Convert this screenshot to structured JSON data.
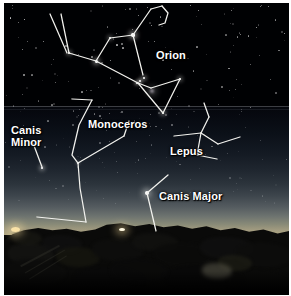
{
  "image": {
    "kind": "night-sky-photograph",
    "title": "Winter constellations above a dark rocky horizon",
    "width": 291,
    "height": 296
  },
  "labels": [
    {
      "id": "orion",
      "text": "Orion",
      "x": 152,
      "y": 47,
      "lines": [
        "Orion"
      ]
    },
    {
      "id": "monoceros",
      "text": "Monoceros",
      "x": 84,
      "y": 116,
      "lines": [
        "Monoceros"
      ]
    },
    {
      "id": "canis-minor",
      "text": "Canis\nMinor",
      "x": 7,
      "y": 122,
      "lines": [
        "Canis",
        "Minor"
      ]
    },
    {
      "id": "lepus",
      "text": "Lepus",
      "x": 166,
      "y": 143,
      "lines": [
        "Lepus"
      ]
    },
    {
      "id": "canis-major",
      "text": "Canis Major",
      "x": 155,
      "y": 188,
      "lines": [
        "Canis Major"
      ]
    }
  ],
  "constellations": [
    {
      "name": "Orion",
      "segments": [
        "46,11 63,50",
        "57,11 65,50",
        "65,50 92,58",
        "92,58 106,35",
        "106,35 129,32",
        "129,32 147,6",
        "147,6 158,3",
        "158,3 164,10 161,20 155,22",
        "129,32 139,72",
        "92,58 134,80",
        "134,80 147,85",
        "147,85 176,76",
        "176,76 159,110",
        "159,110 134,80"
      ]
    },
    {
      "name": "Monoceros",
      "segments": [
        "68,96 88,97",
        "88,97 75,122 68,152 74,160",
        "74,160 120,133",
        "120,133 125,118",
        "74,160 76,185 82,219",
        "82,219 33,214"
      ]
    },
    {
      "name": "Canis Minor",
      "segments": [
        "29,140 38,164"
      ]
    },
    {
      "name": "Lepus",
      "segments": [
        "170,133 197,130",
        "197,130 205,114",
        "205,114 200,100",
        "197,130 214,141",
        "214,141 236,134",
        "197,130 193,152",
        "193,152 213,156"
      ]
    },
    {
      "name": "Canis Major",
      "segments": [
        "143,190 164,172",
        "143,190 152,228"
      ]
    }
  ],
  "stars": [
    {
      "name": "Betelgeuse",
      "x": 129,
      "y": 32,
      "size": 3.4,
      "brightness": 1.0
    },
    {
      "name": "Bellatrix",
      "x": 106,
      "y": 35,
      "size": 2.6,
      "brightness": 0.9
    },
    {
      "name": "Alnitak",
      "x": 140,
      "y": 75,
      "size": 2.6,
      "brightness": 1.0
    },
    {
      "name": "Alnilam",
      "x": 136,
      "y": 78,
      "size": 2.4,
      "brightness": 1.0
    },
    {
      "name": "Mintaka",
      "x": 133,
      "y": 80,
      "size": 2.4,
      "brightness": 1.0
    },
    {
      "name": "Orion Nebula",
      "x": 148,
      "y": 88,
      "size": 4.2,
      "brightness": 0.75
    },
    {
      "name": "Rigel",
      "x": 159,
      "y": 110,
      "size": 2.8,
      "brightness": 1.0
    },
    {
      "name": "Saiph",
      "x": 176,
      "y": 76,
      "size": 2.6,
      "brightness": 0.95
    },
    {
      "name": "Orion Bow",
      "x": 65,
      "y": 50,
      "size": 2.8,
      "brightness": 0.95
    },
    {
      "name": "Orion Left",
      "x": 92,
      "y": 58,
      "size": 3.0,
      "brightness": 1.0
    },
    {
      "name": "Procyon",
      "x": 38,
      "y": 165,
      "size": 2.8,
      "brightness": 1.0
    },
    {
      "name": "Sirius",
      "x": 143,
      "y": 190,
      "size": 4.0,
      "brightness": 1.0
    },
    {
      "name": "Mono Node",
      "x": 74,
      "y": 160,
      "size": 1.8,
      "brightness": 0.7
    }
  ],
  "horizon": {
    "light_left": {
      "x": 11,
      "y": 228
    },
    "light_center": {
      "x": 118,
      "y": 228
    }
  }
}
